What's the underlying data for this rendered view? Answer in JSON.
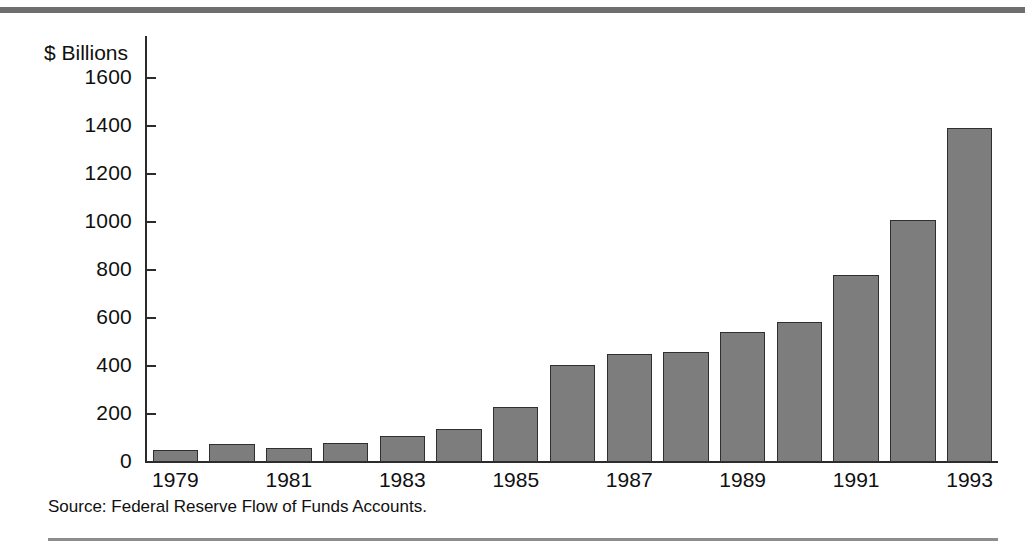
{
  "chart_data": {
    "type": "bar",
    "title": "",
    "subtitle": "",
    "xlabel": "",
    "ylabel": "$ Billions",
    "ylim": [
      0,
      1700
    ],
    "grid": false,
    "legend": null,
    "y_ticks": [
      0,
      200,
      400,
      600,
      800,
      1000,
      1200,
      1400,
      1600
    ],
    "y_tick_labels": [
      "0",
      "200",
      "400",
      "600",
      "800",
      "1000",
      "1200",
      "1400",
      "1600"
    ],
    "categories": [
      "1979",
      "1980",
      "1981",
      "1982",
      "1983",
      "1984",
      "1985",
      "1986",
      "1987",
      "1988",
      "1989",
      "1990",
      "1991",
      "1992",
      "1993"
    ],
    "x_tick_labels": [
      "1979",
      "1981",
      "1983",
      "1985",
      "1987",
      "1989",
      "1991",
      "1993"
    ],
    "values": [
      50,
      75,
      58,
      78,
      110,
      138,
      230,
      405,
      450,
      458,
      543,
      585,
      780,
      1010,
      1390
    ],
    "bar_color": "#7d7d7d",
    "bar_edge_color": "#2f2f2f",
    "annotations": [
      "Source:  Federal Reserve Flow of Funds Accounts."
    ]
  },
  "figure": {
    "axis_title": "$ Billions",
    "source_note": "Source:  Federal Reserve Flow of Funds Accounts.",
    "rule_color": "#6e6e6e",
    "axis_color": "#2b2b2b",
    "background": "#ffffff"
  }
}
